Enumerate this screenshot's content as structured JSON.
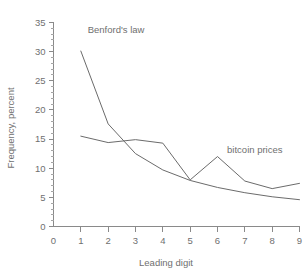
{
  "chart_data": {
    "type": "line",
    "title": "",
    "xlabel": "Leading digit",
    "ylabel": "Frequency, percent",
    "x": [
      1,
      2,
      3,
      4,
      5,
      6,
      7,
      8,
      9
    ],
    "xlim": [
      0,
      9
    ],
    "ylim": [
      0,
      35
    ],
    "x_ticks": [
      "0",
      "1",
      "2",
      "3",
      "4",
      "5",
      "6",
      "7",
      "8",
      "9"
    ],
    "y_ticks": [
      "0",
      "5",
      "10",
      "15",
      "20",
      "25",
      "30",
      "35"
    ],
    "y_minor_step": 1,
    "grid": false,
    "legend_position": "inline-annotations",
    "series": [
      {
        "name": "Benford's law",
        "label_x": 1.25,
        "label_y": 33.2,
        "color": "#6b6b6b",
        "values": [
          30.1,
          17.6,
          12.5,
          9.7,
          7.9,
          6.7,
          5.8,
          5.1,
          4.6
        ]
      },
      {
        "name": "bitcoin prices",
        "label_x": 6.35,
        "label_y": 12.6,
        "color": "#6b6b6b",
        "values": [
          15.5,
          14.4,
          14.9,
          14.3,
          8.0,
          12.0,
          7.8,
          6.5,
          7.4
        ]
      }
    ]
  },
  "axes": {
    "x_title": "Leading digit",
    "y_title": "Frequency, percent"
  }
}
